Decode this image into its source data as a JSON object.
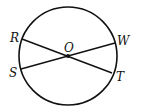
{
  "diagram": {
    "type": "circle-with-chords",
    "stroke_color": "#111111",
    "circle": {
      "center": [
        68,
        56
      ],
      "radius": 49
    },
    "center_point": {
      "label": "O",
      "x": 68,
      "y": 56
    },
    "points": [
      {
        "label": "R",
        "x": 22,
        "y": 39
      },
      {
        "label": "W",
        "x": 115,
        "y": 43
      },
      {
        "label": "S",
        "x": 21,
        "y": 69
      },
      {
        "label": "T",
        "x": 112,
        "y": 73
      }
    ],
    "segments": [
      {
        "from": "R",
        "to": "T"
      },
      {
        "from": "S",
        "to": "W"
      }
    ],
    "labels": {
      "R": "R",
      "W": "W",
      "S": "S",
      "T": "T",
      "O": "O"
    }
  }
}
